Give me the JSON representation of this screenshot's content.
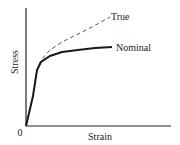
{
  "chart_data": {
    "type": "line",
    "title": "",
    "xlabel": "Strain",
    "ylabel": "Stress",
    "origin_label": "0",
    "grid": false,
    "legend_position": "inline-end-of-line",
    "series": [
      {
        "name": "True",
        "style": "dashed",
        "color": "#555555",
        "points_px": [
          [
            26,
            126
          ],
          [
            33,
            96
          ],
          [
            37,
            70
          ],
          [
            41,
            60
          ],
          [
            50,
            50
          ],
          [
            62,
            42
          ],
          [
            76,
            35
          ],
          [
            92,
            27
          ],
          [
            110,
            17
          ]
        ]
      },
      {
        "name": "Nominal",
        "style": "solid",
        "color": "#1a1a1a",
        "points_px": [
          [
            26,
            126
          ],
          [
            33,
            96
          ],
          [
            37,
            70
          ],
          [
            41,
            62
          ],
          [
            50,
            56
          ],
          [
            62,
            52
          ],
          [
            78,
            50
          ],
          [
            95,
            48
          ],
          [
            112,
            47
          ]
        ]
      }
    ],
    "x_axis": {
      "ticks": [],
      "range_px": [
        26,
        171
      ]
    },
    "y_axis": {
      "ticks": [],
      "range_px": [
        126,
        8
      ]
    }
  },
  "labels": {
    "true": "True",
    "nominal": "Nominal",
    "xlabel": "Strain",
    "ylabel": "Stress",
    "origin": "0"
  }
}
